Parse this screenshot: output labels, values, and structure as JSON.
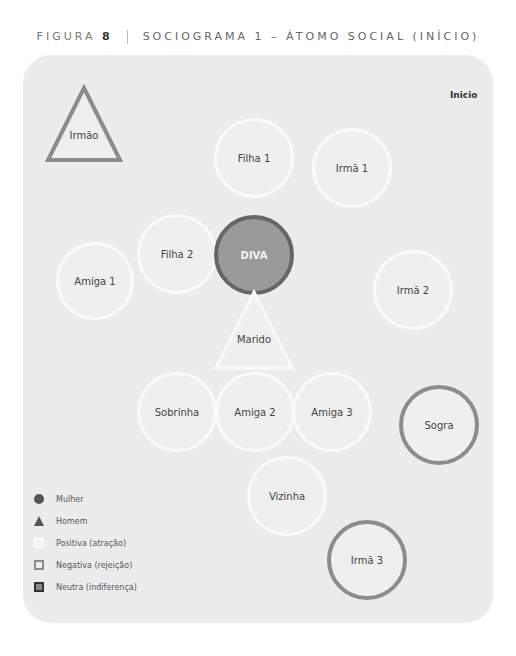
{
  "figure": {
    "label": "FIGURA",
    "number": "8",
    "title": "SOCIOGRAMA 1 – ÁTOMO SOCIAL (INÍCIO)"
  },
  "panel": {
    "tag": "Inicio",
    "colors": {
      "background": "#ececec",
      "positive_fill": "#efefef",
      "positive_border": "#fafafa",
      "negative_border": "#8c8c8c",
      "neutral_fill": "#9a9a9a",
      "neutral_border": "#666666"
    }
  },
  "nodes": {
    "irmao": {
      "label": "Irmão",
      "shape": "triangle",
      "relation": "negative"
    },
    "filha1": {
      "label": "Filha 1",
      "shape": "circle",
      "relation": "positive"
    },
    "irma1": {
      "label": "Irmã 1",
      "shape": "circle",
      "relation": "positive"
    },
    "filha2": {
      "label": "Filha 2",
      "shape": "circle",
      "relation": "positive"
    },
    "diva": {
      "label": "DIVA",
      "shape": "circle",
      "relation": "neutral"
    },
    "amiga1": {
      "label": "Amiga 1",
      "shape": "circle",
      "relation": "positive"
    },
    "irma2": {
      "label": "Irmã 2",
      "shape": "circle",
      "relation": "positive"
    },
    "marido": {
      "label": "Marido",
      "shape": "triangle",
      "relation": "positive"
    },
    "sobrinha": {
      "label": "Sobrinha",
      "shape": "circle",
      "relation": "positive"
    },
    "amiga2": {
      "label": "Amiga 2",
      "shape": "circle",
      "relation": "positive"
    },
    "amiga3": {
      "label": "Amiga 3",
      "shape": "circle",
      "relation": "positive"
    },
    "sogra": {
      "label": "Sogra",
      "shape": "circle",
      "relation": "negative"
    },
    "vizinha": {
      "label": "Vizinha",
      "shape": "circle",
      "relation": "positive"
    },
    "irma3": {
      "label": "Irmã 3",
      "shape": "circle",
      "relation": "negative"
    }
  },
  "legend": {
    "items": [
      {
        "label": "Mulher",
        "symbol": "circle"
      },
      {
        "label": "Homem",
        "symbol": "triangle"
      },
      {
        "label": "Positiva (atração)",
        "symbol": "square-positive"
      },
      {
        "label": "Negativa (rejeição)",
        "symbol": "square-negative"
      },
      {
        "label": "Neutra (indiferença)",
        "symbol": "square-neutral"
      }
    ]
  }
}
